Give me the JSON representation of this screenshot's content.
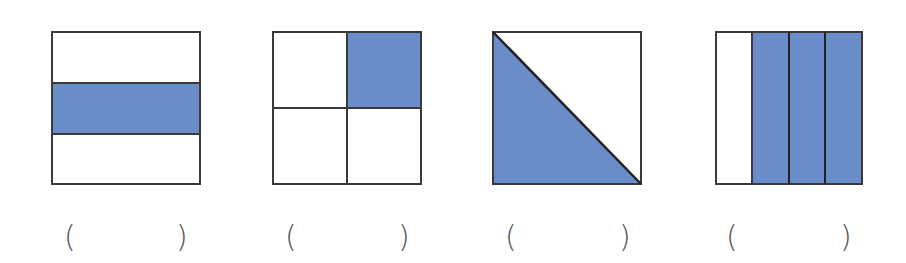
{
  "colors": {
    "fill": "#6a8cc8",
    "stroke": "#3a3a3a",
    "background": "#ffffff"
  },
  "figures": [
    {
      "id": 1,
      "description": "Square divided into 3 horizontal strips; middle strip shaded",
      "parts": 3,
      "shaded": 1
    },
    {
      "id": 2,
      "description": "Square divided into 4 equal squares; top-right shaded",
      "parts": 4,
      "shaded": 1
    },
    {
      "id": 3,
      "description": "Square divided by diagonal into 2 triangles; bottom-left triangle shaded",
      "parts": 2,
      "shaded": 1
    },
    {
      "id": 4,
      "description": "Square divided into 4 vertical strips; right 3 shaded",
      "parts": 4,
      "shaded": 3
    }
  ],
  "answers": [
    {
      "open": "(",
      "close": ")",
      "value": ""
    },
    {
      "open": "(",
      "close": ")",
      "value": ""
    },
    {
      "open": "(",
      "close": ")",
      "value": ""
    },
    {
      "open": "(",
      "close": ")",
      "value": ""
    }
  ]
}
